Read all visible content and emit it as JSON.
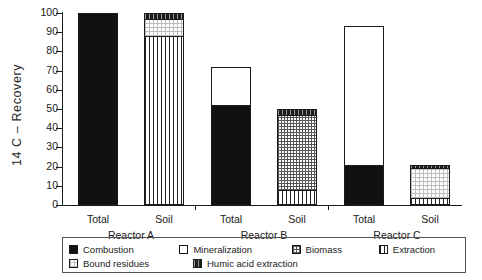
{
  "chart_data": {
    "type": "bar",
    "title": "",
    "subtitle": "",
    "xlabel": "",
    "ylabel": "14 C – Recovery",
    "ylim": [
      0,
      100
    ],
    "yticks": [
      0,
      10,
      20,
      30,
      40,
      50,
      60,
      70,
      80,
      90,
      100
    ],
    "grid": false,
    "stacked": true,
    "legend_position": "bottom",
    "groups": [
      "Reactor A",
      "Reactor B",
      "Reactor C"
    ],
    "categories": [
      "Total",
      "Soil",
      "Total",
      "Soil",
      "Total",
      "Soil"
    ],
    "series": [
      {
        "name": "Combustion",
        "values": [
          100,
          0,
          52,
          0,
          20,
          0
        ]
      },
      {
        "name": "Mineralization",
        "values": [
          0,
          0,
          20,
          0,
          73,
          0
        ]
      },
      {
        "name": "Biomass",
        "values": [
          0,
          0,
          0,
          40,
          0,
          0
        ]
      },
      {
        "name": "Extraction",
        "values": [
          0,
          88,
          0,
          7,
          0,
          3
        ]
      },
      {
        "name": "Bound residues",
        "values": [
          0,
          9,
          0,
          0,
          0,
          16
        ]
      },
      {
        "name": "Humic acid extraction",
        "values": [
          0,
          3,
          0,
          3,
          0,
          2
        ]
      }
    ],
    "bar_totals": [
      100,
      100,
      72,
      50,
      93,
      21
    ],
    "bars": [
      {
        "group": "Reactor A",
        "category": "Total",
        "total": 100,
        "segments": [
          {
            "series": "Combustion",
            "value": 100,
            "from": 0,
            "to": 100
          }
        ]
      },
      {
        "group": "Reactor A",
        "category": "Soil",
        "total": 100,
        "segments": [
          {
            "series": "Extraction",
            "value": 88,
            "from": 0,
            "to": 88
          },
          {
            "series": "Bound residues",
            "value": 9,
            "from": 88,
            "to": 97
          },
          {
            "series": "Humic acid extraction",
            "value": 3,
            "from": 97,
            "to": 100
          }
        ]
      },
      {
        "group": "Reactor B",
        "category": "Total",
        "total": 72,
        "segments": [
          {
            "series": "Combustion",
            "value": 52,
            "from": 0,
            "to": 52
          },
          {
            "series": "Mineralization",
            "value": 20,
            "from": 52,
            "to": 72
          }
        ]
      },
      {
        "group": "Reactor B",
        "category": "Soil",
        "total": 50,
        "segments": [
          {
            "series": "Extraction",
            "value": 7,
            "from": 0,
            "to": 7
          },
          {
            "series": "Biomass",
            "value": 40,
            "from": 7,
            "to": 47
          },
          {
            "series": "Humic acid extraction",
            "value": 3,
            "from": 47,
            "to": 50
          }
        ]
      },
      {
        "group": "Reactor C",
        "category": "Total",
        "total": 93,
        "segments": [
          {
            "series": "Combustion",
            "value": 20,
            "from": 0,
            "to": 20
          },
          {
            "series": "Mineralization",
            "value": 73,
            "from": 20,
            "to": 93
          }
        ]
      },
      {
        "group": "Reactor C",
        "category": "Soil",
        "total": 21,
        "segments": [
          {
            "series": "Extraction",
            "value": 3,
            "from": 0,
            "to": 3
          },
          {
            "series": "Bound residues",
            "value": 16,
            "from": 3,
            "to": 19
          },
          {
            "series": "Humic acid extraction",
            "value": 2,
            "from": 19,
            "to": 21
          }
        ]
      }
    ],
    "legend": [
      {
        "label": "Combustion",
        "pattern": "solid-black"
      },
      {
        "label": "Mineralization",
        "pattern": "white"
      },
      {
        "label": "Biomass",
        "pattern": "dense-checker"
      },
      {
        "label": "Extraction",
        "pattern": "vertical-stripes"
      },
      {
        "label": "Bound residues",
        "pattern": "light-dots"
      },
      {
        "label": "Humic acid extraction",
        "pattern": "dark-stripes"
      }
    ]
  },
  "axis": {
    "y_title": "14 C – Recovery",
    "y_tick_labels": [
      "0",
      "10",
      "20",
      "30",
      "40",
      "50",
      "60",
      "70",
      "80",
      "90",
      "100"
    ]
  },
  "xaxis": {
    "cat_labels": [
      "Total",
      "Soil",
      "Total",
      "Soil",
      "Total",
      "Soil"
    ],
    "group_labels": [
      "Reactor A",
      "Reactor B",
      "Reactor C"
    ]
  },
  "legend": {
    "items": [
      {
        "label": "Combustion"
      },
      {
        "label": "Mineralization"
      },
      {
        "label": "Biomass"
      },
      {
        "label": "Extraction"
      },
      {
        "label": "Bound residues"
      },
      {
        "label": "Humic acid extraction"
      }
    ]
  },
  "colors": {
    "ink": "#1a1a1a",
    "combustion": "#111111",
    "mineralization": "#ffffff",
    "biomass_rule": "#555555",
    "extraction_rule": "#222222",
    "bound_rule": "#bdbdbd",
    "humic": "#1c1c1c"
  }
}
